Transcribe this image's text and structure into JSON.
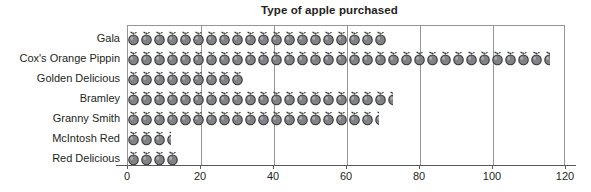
{
  "chart_data": {
    "type": "bar",
    "variant": "pictogram",
    "title": "Type of apple purchased",
    "xlabel": "",
    "ylabel": "",
    "categories": [
      "Gala",
      "Cox's Orange Pippin",
      "Golden Delicious",
      "Bramley",
      "Granny Smith",
      "McIntosh Red",
      "Red Delicious"
    ],
    "values": [
      71,
      116,
      32,
      73,
      69,
      12,
      14
    ],
    "xlim": [
      0,
      120
    ],
    "xticks": [
      0,
      20,
      40,
      60,
      80,
      100,
      120
    ],
    "xticklabels": [
      "0",
      "20",
      "40",
      "60",
      "80",
      "100",
      "120"
    ],
    "gridlines": [
      20,
      40,
      60,
      80,
      100
    ],
    "grid": true,
    "legend": null,
    "icon": "apple-icon",
    "icon_unit_value": 2.5,
    "colors": {
      "icon_fill": "#808285",
      "icon_outline": "#3b3b3d",
      "axis": "#58595b",
      "gridline": "#939598",
      "text": "#231f20",
      "background": "#ffffff"
    }
  }
}
